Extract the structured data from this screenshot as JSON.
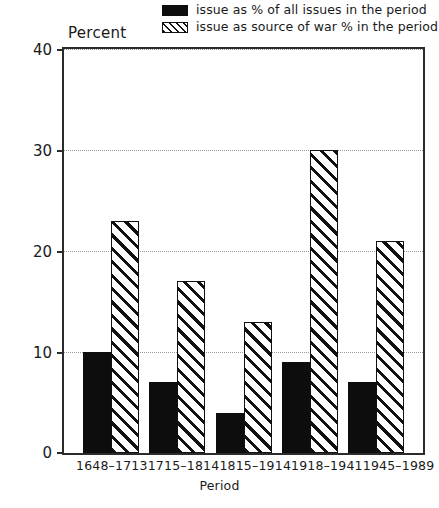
{
  "chart_data": {
    "type": "bar",
    "title": "",
    "subtitle": "",
    "xlabel": "Period",
    "ylabel": "Percent",
    "categories": [
      "1648–1713",
      "1715–1814",
      "1815–1914",
      "1918–1941",
      "1945–1989"
    ],
    "series": [
      {
        "name": "issue as % of all issues in the period",
        "style": "solid-black",
        "color": "#0d0d0d",
        "values": [
          10,
          7,
          4,
          9,
          7
        ]
      },
      {
        "name": "issue as source of war % in the period",
        "style": "diagonal-hatch",
        "color": "#111111",
        "values": [
          23,
          17,
          13,
          30,
          21
        ]
      }
    ],
    "ylim": [
      0,
      40
    ],
    "yticks": [
      0,
      10,
      20,
      30,
      40
    ],
    "ytick_labels": [
      "0",
      "10",
      "20",
      "30",
      "40"
    ],
    "gridlines": [
      10,
      20,
      30
    ],
    "grid": true,
    "legend_position": "top-right"
  },
  "legend": {
    "items": [
      {
        "label": "issue as % of all issues in the period",
        "swatch": "solid-black-swatch"
      },
      {
        "label": "issue as source of war % in the period",
        "swatch": "hatched-swatch"
      }
    ]
  },
  "axes": {
    "y_title": "Percent",
    "x_title": "Period"
  },
  "caption": {
    "text": ""
  }
}
